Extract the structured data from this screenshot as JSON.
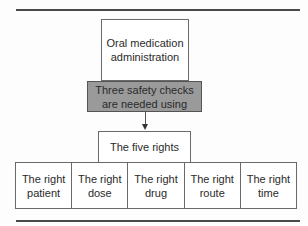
{
  "diagram": {
    "root": {
      "line1": "Oral medication",
      "line2": "administration"
    },
    "checks": {
      "line1": "Three safety checks",
      "line2": "are needed using"
    },
    "five_rights": {
      "label": "The five rights"
    },
    "rights": [
      {
        "line1": "The right",
        "line2": "patient"
      },
      {
        "line1": "The right",
        "line2": "dose"
      },
      {
        "line1": "The right",
        "line2": "drug"
      },
      {
        "line1": "The right",
        "line2": "route"
      },
      {
        "line1": "The right",
        "line2": "time"
      }
    ],
    "colors": {
      "checks_fill": "#9a9a9a",
      "border": "#6a6a6a",
      "rule": "#4a4a4a"
    }
  }
}
